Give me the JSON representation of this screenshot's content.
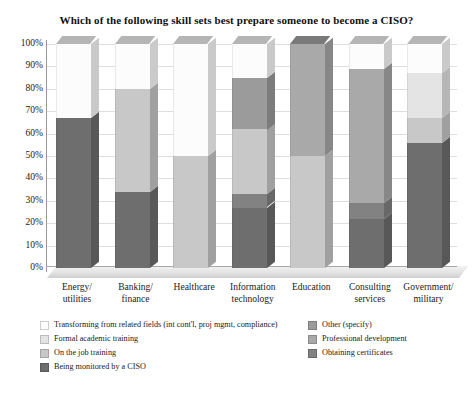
{
  "chart_data": {
    "type": "bar",
    "subtype": "stacked-column-100-percent-3d",
    "title": "Which of the following skill sets best prepare someone to become a CISO?",
    "xlabel": "",
    "ylabel": "",
    "ylim": [
      0,
      100
    ],
    "ytick_labels": [
      "100%",
      "90%",
      "80%",
      "70%",
      "60%",
      "50%",
      "40%",
      "30%",
      "20%",
      "10%",
      "0%"
    ],
    "ytick_values": [
      100,
      90,
      80,
      70,
      60,
      50,
      40,
      30,
      20,
      10,
      0
    ],
    "grid": true,
    "legend_position": "bottom",
    "categories": [
      "Energy/\nutilities",
      "Banking/\nfinance",
      "Healthcare",
      "Information\ntechnology",
      "Education",
      "Consulting\nservices",
      "Government/\nmilitary"
    ],
    "series": [
      {
        "name": "Being monitored by a CISO",
        "color": "#6e6e6e",
        "values": [
          67,
          34,
          0,
          27,
          0,
          22,
          56
        ]
      },
      {
        "name": "Obtaining certificates",
        "color": "#828282",
        "values": [
          0,
          0,
          0,
          6,
          0,
          7,
          0
        ]
      },
      {
        "name": "On the job training",
        "color": "#c8c8c8",
        "values": [
          0,
          46,
          50,
          29,
          50,
          0,
          11
        ]
      },
      {
        "name": "Professional development",
        "color": "#a9a9a9",
        "values": [
          0,
          0,
          0,
          0,
          50,
          60,
          0
        ]
      },
      {
        "name": "Other (specify)",
        "color": "#9b9b9b",
        "values": [
          0,
          0,
          0,
          23,
          0,
          0,
          0
        ]
      },
      {
        "name": "Formal academic training",
        "color": "#e4e4e4",
        "values": [
          0,
          0,
          0,
          0,
          0,
          0,
          20
        ]
      },
      {
        "name": "Transforming from related fields (int cont'l, proj mgmt, compliance)",
        "color": "#fcfcfc",
        "values": [
          33,
          20,
          50,
          15,
          0,
          11,
          13
        ]
      }
    ]
  },
  "legend": {
    "left_column": [
      {
        "label": "Transforming from related fields (int cont'l, proj mgmt, compliance)",
        "color": "#fcfcfc"
      },
      {
        "label": "Formal academic training",
        "color": "#e4e4e4"
      },
      {
        "label": "On the job training",
        "color": "#c8c8c8"
      },
      {
        "label": "Being monitored by a CISO",
        "color": "#6e6e6e"
      }
    ],
    "right_column": [
      {
        "label": "Other (specify)",
        "color": "#9b9b9b"
      },
      {
        "label": "Professional development",
        "color": "#a9a9a9"
      },
      {
        "label": "Obtaining certificates",
        "color": "#828282"
      }
    ]
  }
}
